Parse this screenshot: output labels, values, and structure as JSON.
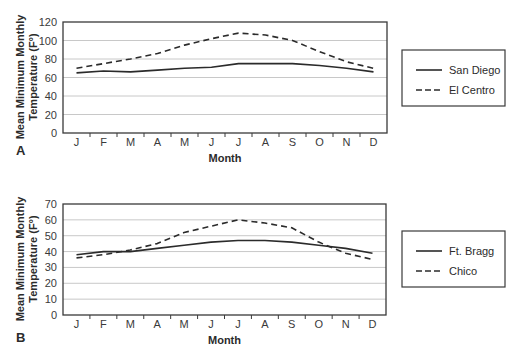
{
  "chart_data": [
    {
      "panel": "A",
      "type": "line",
      "title": "",
      "xlabel": "Month",
      "ylabel": "Mean Minimum Monthly Temperature (F°)",
      "ylabel_lines": [
        "Mean Minimum Monthly",
        "Temperature (F°)"
      ],
      "categories": [
        "J",
        "F",
        "M",
        "A",
        "M",
        "J",
        "J",
        "A",
        "S",
        "O",
        "N",
        "D"
      ],
      "ylim": [
        0,
        120
      ],
      "yticks": [
        0,
        20,
        40,
        60,
        80,
        100,
        120
      ],
      "grid": true,
      "legend_position": "right",
      "series": [
        {
          "name": "San Diego",
          "style": "solid",
          "values": [
            65,
            67,
            66,
            68,
            70,
            71,
            75,
            75,
            75,
            73,
            70,
            66
          ]
        },
        {
          "name": "El Centro",
          "style": "dashed",
          "values": [
            70,
            75,
            80,
            86,
            95,
            102,
            108,
            106,
            100,
            88,
            77,
            70
          ]
        }
      ]
    },
    {
      "panel": "B",
      "type": "line",
      "title": "",
      "xlabel": "Month",
      "ylabel": "Mean Minimum Monthly Temperature (F°)",
      "ylabel_lines": [
        "Mean Minimum Monthly",
        "Temperature (F°)"
      ],
      "categories": [
        "J",
        "F",
        "M",
        "A",
        "M",
        "J",
        "J",
        "A",
        "S",
        "O",
        "N",
        "D"
      ],
      "ylim": [
        0,
        70
      ],
      "yticks": [
        0,
        10,
        20,
        30,
        40,
        50,
        60,
        70
      ],
      "grid": true,
      "legend_position": "right",
      "series": [
        {
          "name": "Ft. Bragg",
          "style": "solid",
          "values": [
            38,
            40,
            40,
            42,
            44,
            46,
            47,
            47,
            46,
            44,
            42,
            39
          ]
        },
        {
          "name": "Chico",
          "style": "dashed",
          "values": [
            36,
            38,
            41,
            45,
            52,
            56,
            60,
            58,
            55,
            46,
            39,
            35
          ]
        }
      ]
    }
  ],
  "colors": {
    "line": "#2b2b2b",
    "grid": "#c8c8c8",
    "frame": "#3a3a3a"
  }
}
